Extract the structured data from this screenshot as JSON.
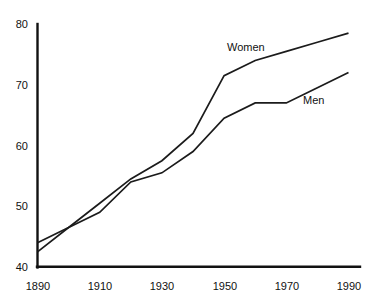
{
  "chart_data": {
    "type": "line",
    "title": "",
    "xlabel": "",
    "ylabel": "",
    "xlim": [
      1890,
      1990
    ],
    "ylim": [
      40,
      80
    ],
    "grid": false,
    "legend_position": "inline-annotation",
    "x_ticks": [
      "1890",
      "1910",
      "1930",
      "1950",
      "1970",
      "1990"
    ],
    "y_ticks": [
      "40",
      "50",
      "60",
      "70",
      "80"
    ],
    "x_tick_values": [
      1890,
      1910,
      1930,
      1950,
      1970,
      1990
    ],
    "y_tick_values": [
      40,
      50,
      60,
      70,
      80
    ],
    "series": [
      {
        "name": "Women",
        "label": "Women",
        "x": [
          1890,
          1900,
          1910,
          1920,
          1930,
          1940,
          1950,
          1960,
          1970,
          1980,
          1990
        ],
        "values": [
          42.5,
          46.5,
          50.5,
          54.5,
          57.5,
          62.0,
          71.5,
          74.0,
          75.5,
          77.0,
          78.5
        ]
      },
      {
        "name": "Men",
        "label": "Men",
        "x": [
          1890,
          1900,
          1910,
          1920,
          1930,
          1940,
          1950,
          1960,
          1970,
          1980,
          1990
        ],
        "values": [
          44.0,
          46.5,
          49.0,
          54.0,
          55.5,
          59.0,
          64.5,
          67.0,
          67.0,
          69.5,
          72.0
        ]
      }
    ],
    "annotations": [
      {
        "text": "Women",
        "x": 1965,
        "y": 76.5
      },
      {
        "text": "Men",
        "x": 1982,
        "y": 67.5
      }
    ],
    "colors": {
      "line": "#1b1b1b",
      "axis": "#111111",
      "background": "#ffffff"
    }
  }
}
